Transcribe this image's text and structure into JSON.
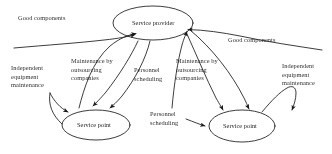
{
  "diagram": {
    "type": "node-arrow-diagram",
    "background_color": "#ffffff",
    "stroke_color": "#1a1a1a",
    "nodes": [
      {
        "id": "service-provider",
        "label": "Service provider",
        "shape": "ellipse",
        "cx": 153,
        "cy": 23,
        "rx": 40,
        "ry": 17
      },
      {
        "id": "service-point-left",
        "label": "Service point",
        "shape": "ellipse",
        "cx": 96,
        "cy": 125,
        "rx": 34,
        "ry": 15
      },
      {
        "id": "service-point-right",
        "label": "Service point",
        "shape": "ellipse",
        "cx": 242,
        "cy": 126,
        "rx": 33,
        "ry": 16
      }
    ],
    "edge_labels": [
      {
        "id": "good-components-left",
        "lines": [
          "Good components"
        ]
      },
      {
        "id": "good-components-right",
        "lines": [
          "Good components"
        ]
      },
      {
        "id": "independent-maintenance-left",
        "lines": [
          "Independent",
          "equipment",
          "maintenance"
        ]
      },
      {
        "id": "independent-maintenance-right",
        "lines": [
          "Independent",
          "equipment",
          "maintenance"
        ]
      },
      {
        "id": "outsourcing-left",
        "lines": [
          "Maintenance by",
          "outsourcing",
          "companies"
        ]
      },
      {
        "id": "outsourcing-right",
        "lines": [
          "Maintenance by",
          "outsourcing",
          "companies"
        ]
      },
      {
        "id": "personnel-scheduling-center",
        "lines": [
          "Personnel",
          "scheduling"
        ]
      },
      {
        "id": "personnel-scheduling-bottom",
        "lines": [
          "Personnel",
          "scheduling"
        ]
      }
    ],
    "edges": [
      {
        "from": "service-point-left",
        "to": "service-provider",
        "label": "Maintenance by outsourcing companies"
      },
      {
        "from": "service-provider",
        "to": "service-point-left",
        "label": "Personnel scheduling"
      },
      {
        "from": "service-provider",
        "to": "service-point-left",
        "label": "Good components"
      },
      {
        "from": "service-point-left",
        "to": "service-point-left",
        "label": "Independent equipment maintenance"
      },
      {
        "from": "service-point-right",
        "to": "service-provider",
        "label": "Maintenance by outsourcing companies"
      },
      {
        "from": "service-provider",
        "to": "service-point-right",
        "label": "Good components"
      },
      {
        "from": "service-point-right",
        "to": "service-point-right",
        "label": "Independent equipment maintenance"
      },
      {
        "from": "service-provider",
        "to": "service-point-right",
        "label": "Personnel scheduling"
      }
    ]
  }
}
